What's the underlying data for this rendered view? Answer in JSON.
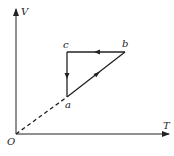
{
  "diagram": {
    "type": "V-T cycle diagram",
    "axes": {
      "y_label": "V",
      "x_label": "T",
      "origin_label": "O"
    },
    "points": [
      {
        "id": "a",
        "label": "a"
      },
      {
        "id": "b",
        "label": "b"
      },
      {
        "id": "c",
        "label": "c"
      }
    ],
    "processes": [
      {
        "from": "a",
        "to": "b",
        "style": "solid",
        "arrow": "toward b"
      },
      {
        "from": "b",
        "to": "c",
        "style": "solid",
        "arrow": "toward c"
      },
      {
        "from": "c",
        "to": "a",
        "style": "solid",
        "arrow": "toward a"
      }
    ],
    "extension": {
      "from": "O",
      "to": "a",
      "style": "dashed"
    },
    "caption": ""
  }
}
